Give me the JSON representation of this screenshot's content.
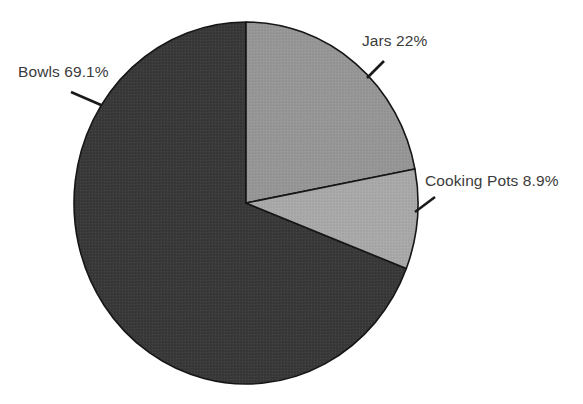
{
  "chart_data": {
    "type": "pie",
    "title": "",
    "subtitle": "",
    "xlabel": "",
    "ylabel": "",
    "legend": "none",
    "grid": false,
    "start_angle_deg": 0,
    "direction": "clockwise",
    "labels": [
      "Jars",
      "Cooking Pots",
      "Bowls"
    ],
    "values": [
      22.0,
      8.9,
      69.1
    ],
    "value_unit": "percent",
    "categories": [
      "Jars",
      "Cooking Pots",
      "Bowls"
    ],
    "slices": [
      {
        "name": "Jars",
        "label": "Jars 22%",
        "value": 22.0,
        "value_text": "22%",
        "color": "#969696",
        "start_angle_deg": 0.0,
        "end_angle_deg": 79.2
      },
      {
        "name": "Cooking Pots",
        "label": "Cooking Pots 8.9%",
        "value": 8.9,
        "value_text": "8.9%",
        "color": "#a8a8a8",
        "start_angle_deg": 79.2,
        "end_angle_deg": 111.24
      },
      {
        "name": "Bowls",
        "label": "Bowls 69.1%",
        "value": 69.1,
        "value_text": "69.1%",
        "color": "#3a3a3a",
        "start_angle_deg": 111.24,
        "end_angle_deg": 360.0
      }
    ]
  },
  "labels": {
    "bowls": "Bowls 69.1%",
    "jars": "Jars 22%",
    "cooking_pots": "Cooking Pots 8.9%"
  },
  "colors": {
    "background": "#ffffff",
    "bowls": "#3a3a3a",
    "jars": "#969696",
    "cooking_pots": "#a8a8a8",
    "slice_outline": "#161616",
    "leader_line": "#1a1a1a",
    "label_text": "#3b3b3b"
  }
}
